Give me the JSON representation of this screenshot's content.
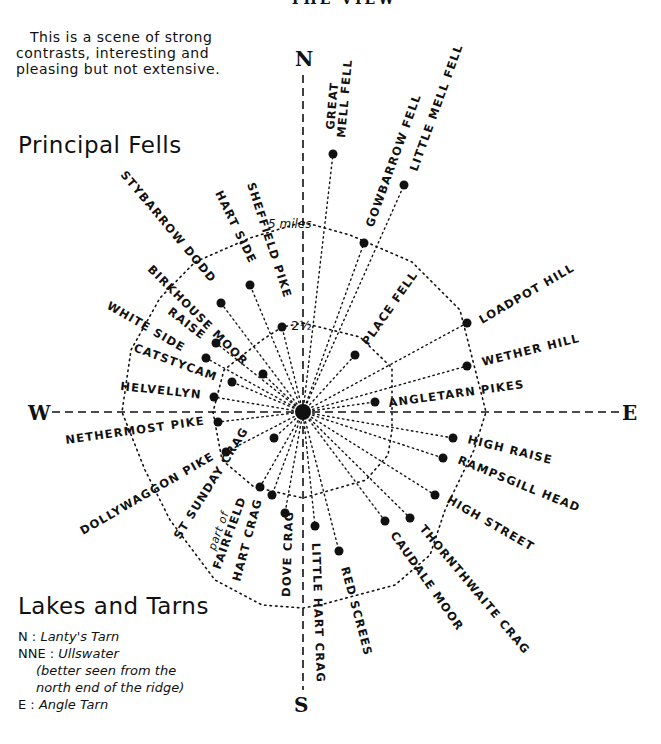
{
  "top_clipped_heading": "THE VIEW",
  "intro": {
    "lines": [
      "This is a scene of strong",
      "contrasts, interesting and",
      "pleasing but not extensive."
    ]
  },
  "principal_fells_heading": "Principal Fells",
  "compass": {
    "north": "N",
    "south": "S",
    "east": "E",
    "west": "W"
  },
  "scale": {
    "outer_label": "5 miles",
    "inner_label": "2½"
  },
  "center": {
    "x": 303,
    "y": 412
  },
  "fells": [
    {
      "name": "GREAT MELL FELL",
      "x": 333,
      "y": 154
    },
    {
      "name": "LITTLE MELL FELL",
      "x": 404,
      "y": 185
    },
    {
      "name": "GOWBARROW FELL",
      "x": 364,
      "y": 243
    },
    {
      "name": "PLACE FELL",
      "x": 355,
      "y": 355
    },
    {
      "name": "LOADPOT HILL",
      "x": 467,
      "y": 323
    },
    {
      "name": "WETHER HILL",
      "x": 467,
      "y": 366
    },
    {
      "name": "ANGLETARN PIKES",
      "x": 375,
      "y": 402
    },
    {
      "name": "HIGH RAISE",
      "x": 453,
      "y": 438
    },
    {
      "name": "RAMPSGILL HEAD",
      "x": 443,
      "y": 458
    },
    {
      "name": "HIGH STREET",
      "x": 435,
      "y": 495
    },
    {
      "name": "THORNTHWAITE CRAG",
      "x": 410,
      "y": 518
    },
    {
      "name": "CAUDALE MOOR",
      "x": 385,
      "y": 521
    },
    {
      "name": "RED SCREES",
      "x": 339,
      "y": 551
    },
    {
      "name": "LITTLE HART CRAG",
      "x": 315,
      "y": 526
    },
    {
      "name": "DOVE CRAG",
      "x": 285,
      "y": 513
    },
    {
      "name": "HART CRAG",
      "x": 272,
      "y": 495
    },
    {
      "name": "part of FAIRFIELD",
      "x": 260,
      "y": 487
    },
    {
      "name": "ST SUNDAY CRAG",
      "x": 274,
      "y": 438
    },
    {
      "name": "DOLLYWAGGON PIKE",
      "x": 226,
      "y": 452
    },
    {
      "name": "NETHERMOST PIKE",
      "x": 218,
      "y": 422
    },
    {
      "name": "HELVELLYN",
      "x": 214,
      "y": 397
    },
    {
      "name": "CATSTYCAM",
      "x": 232,
      "y": 382
    },
    {
      "name": "WHITE SIDE",
      "x": 206,
      "y": 358
    },
    {
      "name": "RAISE",
      "x": 216,
      "y": 343
    },
    {
      "name": "BIRKHOUSE MOOR",
      "x": 263,
      "y": 374
    },
    {
      "name": "STYBARROW DODD",
      "x": 221,
      "y": 303
    },
    {
      "name": "HART SIDE",
      "x": 250,
      "y": 285
    },
    {
      "name": "SHEFFIELD PIKE",
      "x": 282,
      "y": 327
    }
  ],
  "labels": {
    "great_mell": [
      "GREAT",
      "MELL FELL"
    ],
    "little_mell": "LITTLE MELL FELL",
    "gowbarrow": "GOWBARROW FELL",
    "place": "PLACE FELL",
    "loadpot": "LOADPOT HILL",
    "wether": "WETHER HILL",
    "angletarn": "ANGLETARN PIKES",
    "high_raise": "HIGH RAISE",
    "rampsgill": "RAMPSGILL HEAD",
    "high_street": "HIGH STREET",
    "thornthwaite": "THORNTHWAITE CRAG",
    "caudale": "CAUDALE MOOR",
    "red_screes": "RED SCREES",
    "little_hart": "LITTLE HART CRAG",
    "dove": "DOVE CRAG",
    "hart_crag": "HART CRAG",
    "fairfield_part": "part of",
    "fairfield": "FAIRFIELD",
    "st_sunday": "ST SUNDAY CRAG",
    "dollywaggon": "DOLLYWAGGON PIKE",
    "nethermost": "NETHERMOST PIKE",
    "helvellyn": "HELVELLYN",
    "catstycam": "CATSTYCAM",
    "white_side": "WHITE SIDE",
    "raise": "RAISE",
    "birkhouse": "BIRKHOUSE MOOR",
    "stybarrow": "STYBARROW DODD",
    "hart_side": "HART SIDE",
    "sheffield": "SHEFFIELD PIKE"
  },
  "lakes_and_tarns": {
    "heading": "Lakes and Tarns",
    "items": [
      {
        "dir": "N :",
        "name": "Lanty's Tarn"
      },
      {
        "dir": "NNE :",
        "name": "Ullswater"
      },
      {
        "dir": "E :",
        "name": "Angle Tarn"
      }
    ],
    "note_lines": [
      "(better seen from the",
      "north end of the ridge)"
    ]
  }
}
